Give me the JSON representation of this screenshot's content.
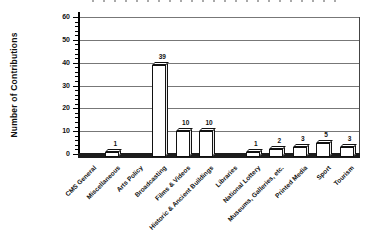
{
  "chart_data": {
    "type": "bar",
    "title": "",
    "xlabel": "",
    "ylabel": "Number of Contributions",
    "ylim": [
      0,
      60
    ],
    "ytick_step": 10,
    "yticks": [
      0,
      10,
      20,
      30,
      40,
      50,
      60
    ],
    "grid": true,
    "legend": "none",
    "style": "3d-effect-white-bars",
    "categories": [
      "CMS General",
      "Miscellaneous",
      "Arts Policy",
      "Broadcasting",
      "Films & Videos",
      "Historic & Ancient Buildings",
      "Libraries",
      "National Lottery",
      "Museums, Galleries, etc.",
      "Printed Media",
      "Sport",
      "Tourism"
    ],
    "values": [
      0,
      1,
      0,
      39,
      10,
      10,
      0,
      1,
      2,
      3,
      5,
      3
    ],
    "bar_labels": [
      "",
      "1",
      "",
      "39",
      "10",
      "10",
      "",
      "1",
      "2",
      "3",
      "5",
      "3"
    ]
  },
  "colors": {
    "bar_fill": "#ffffff",
    "bar_border": "#111111",
    "grid": "#777777",
    "axis": "#000000",
    "floor": "#1c1c1c",
    "text": "#111111",
    "background": "#ffffff"
  }
}
